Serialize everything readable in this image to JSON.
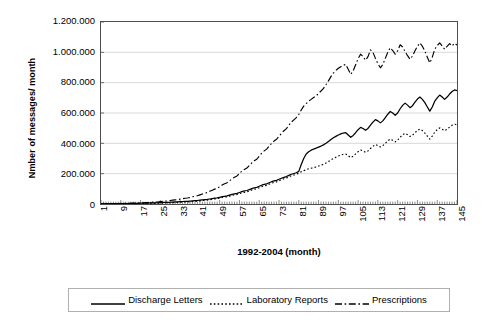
{
  "chart_data": {
    "type": "line",
    "title": "",
    "xlabel": "1992-2004 (month)",
    "ylabel": "Nmber of messages/ month",
    "xlim": [
      1,
      145
    ],
    "ylim": [
      0,
      1200000
    ],
    "grid": true,
    "legend_position": "bottom",
    "y_ticks": [
      "1.200.000",
      "1.000.000",
      "800.000",
      "600.000",
      "400.000",
      "200.000",
      "0"
    ],
    "y_tick_values": [
      1200000,
      1000000,
      800000,
      600000,
      400000,
      200000,
      0
    ],
    "x_ticks": [
      "1",
      "9",
      "17",
      "25",
      "33",
      "41",
      "49",
      "57",
      "65",
      "73",
      "81",
      "89",
      "97",
      "105",
      "113",
      "121",
      "129",
      "137",
      "145"
    ],
    "x_tick_values": [
      1,
      9,
      17,
      25,
      33,
      41,
      49,
      57,
      65,
      73,
      81,
      89,
      97,
      105,
      113,
      121,
      129,
      137,
      145
    ],
    "x": [
      1,
      2,
      3,
      4,
      5,
      6,
      7,
      8,
      9,
      10,
      11,
      12,
      13,
      14,
      15,
      16,
      17,
      18,
      19,
      20,
      21,
      22,
      23,
      24,
      25,
      26,
      27,
      28,
      29,
      30,
      31,
      32,
      33,
      34,
      35,
      36,
      37,
      38,
      39,
      40,
      41,
      42,
      43,
      44,
      45,
      46,
      47,
      48,
      49,
      50,
      51,
      52,
      53,
      54,
      55,
      56,
      57,
      58,
      59,
      60,
      61,
      62,
      63,
      64,
      65,
      66,
      67,
      68,
      69,
      70,
      71,
      72,
      73,
      74,
      75,
      76,
      77,
      78,
      79,
      80,
      81,
      82,
      83,
      84,
      85,
      86,
      87,
      88,
      89,
      90,
      91,
      92,
      93,
      94,
      95,
      96,
      97,
      98,
      99,
      100,
      101,
      102,
      103,
      104,
      105,
      106,
      107,
      108,
      109,
      110,
      111,
      112,
      113,
      114,
      115,
      116,
      117,
      118,
      119,
      120,
      121,
      122,
      123,
      124,
      125,
      126,
      127,
      128,
      129,
      130,
      131,
      132,
      133,
      134,
      135,
      136,
      137,
      138,
      139,
      140,
      141,
      142,
      143,
      144,
      145
    ],
    "series": [
      {
        "name": "Discharge Letters",
        "style": "solid",
        "color": "#000000",
        "values": [
          1000,
          1200,
          1500,
          1400,
          1800,
          2000,
          2200,
          2100,
          2600,
          3000,
          3200,
          3000,
          3500,
          4000,
          4200,
          4500,
          5000,
          5500,
          6000,
          6200,
          7000,
          7500,
          8000,
          8200,
          9000,
          10000,
          11000,
          11500,
          12000,
          13000,
          14000,
          14500,
          15500,
          16500,
          17500,
          18000,
          19500,
          21000,
          22000,
          23000,
          25000,
          27000,
          29000,
          30000,
          33000,
          36000,
          38000,
          40000,
          44000,
          48000,
          51000,
          53000,
          58000,
          63000,
          67000,
          70000,
          76000,
          82000,
          86000,
          89000,
          95000,
          101000,
          106000,
          110000,
          117000,
          124000,
          129000,
          133000,
          140000,
          147000,
          152000,
          156000,
          163000,
          170000,
          176000,
          181000,
          189000,
          196000,
          201000,
          206000,
          215000,
          260000,
          300000,
          330000,
          345000,
          355000,
          362000,
          368000,
          375000,
          382000,
          390000,
          400000,
          412000,
          425000,
          437000,
          446000,
          455000,
          462000,
          468000,
          470000,
          455000,
          440000,
          452000,
          470000,
          490000,
          505000,
          498000,
          486000,
          498000,
          520000,
          540000,
          556000,
          548000,
          535000,
          548000,
          570000,
          592000,
          610000,
          600000,
          585000,
          600000,
          628000,
          650000,
          665000,
          652000,
          635000,
          648000,
          672000,
          692000,
          705000,
          690000,
          668000,
          640000,
          612000,
          640000,
          678000,
          700000,
          718000,
          705000,
          690000,
          705000,
          725000,
          742000,
          752000,
          748000
        ]
      },
      {
        "name": "Laboratory Reports",
        "style": "dotted",
        "color": "#000000",
        "values": [
          500,
          600,
          800,
          700,
          900,
          1000,
          1100,
          1000,
          1300,
          1500,
          1600,
          1500,
          1800,
          2000,
          2100,
          2200,
          2600,
          2900,
          3200,
          3300,
          3800,
          4200,
          4600,
          4800,
          5500,
          6200,
          6800,
          7200,
          8000,
          8800,
          9500,
          9800,
          11000,
          12000,
          13000,
          13500,
          15000,
          16500,
          17500,
          18500,
          20500,
          22500,
          24500,
          25500,
          28500,
          31000,
          33500,
          35000,
          39000,
          42500,
          45500,
          47500,
          52000,
          56500,
          60000,
          62500,
          68000,
          73000,
          77000,
          80000,
          86000,
          92000,
          97000,
          100000,
          107000,
          114000,
          119000,
          123000,
          130000,
          137000,
          142000,
          146000,
          153000,
          160000,
          166000,
          171000,
          179000,
          186000,
          191000,
          196000,
          203000,
          212000,
          220000,
          226000,
          232000,
          236000,
          240000,
          244000,
          250000,
          256000,
          262000,
          270000,
          280000,
          290000,
          300000,
          308000,
          316000,
          322000,
          328000,
          330000,
          318000,
          306000,
          315000,
          330000,
          345000,
          356000,
          350000,
          341000,
          350000,
          366000,
          380000,
          392000,
          385000,
          376000,
          385000,
          400000,
          416000,
          428000,
          420000,
          410000,
          421000,
          440000,
          456000,
          466000,
          457000,
          445000,
          454000,
          470000,
          485000,
          494000,
          484000,
          468000,
          448000,
          428000,
          448000,
          474000,
          490000,
          502000,
          493000,
          483000,
          493000,
          507000,
          519000,
          526000,
          523000
        ]
      },
      {
        "name": "Prescriptions",
        "style": "dashdot",
        "color": "#000000",
        "values": [
          1500,
          1800,
          2200,
          2000,
          2600,
          2900,
          3200,
          3000,
          3800,
          4400,
          4700,
          4400,
          5200,
          5900,
          6200,
          6600,
          7600,
          8400,
          9200,
          9500,
          11000,
          12000,
          13000,
          13500,
          15500,
          17500,
          19500,
          20500,
          23000,
          25500,
          27500,
          28500,
          32000,
          35000,
          38000,
          39500,
          43500,
          48000,
          51000,
          54000,
          60000,
          66000,
          72000,
          75000,
          84000,
          91000,
          98000,
          103000,
          114000,
          125000,
          134000,
          140000,
          153000,
          166000,
          177000,
          185000,
          201000,
          217000,
          228000,
          237000,
          254000,
          271000,
          285000,
          295000,
          315000,
          335000,
          350000,
          362000,
          382000,
          400000,
          415000,
          427000,
          447000,
          466000,
          483000,
          497000,
          520000,
          540000,
          555000,
          570000,
          590000,
          620000,
          645000,
          662000,
          678000,
          690000,
          702000,
          712000,
          730000,
          745000,
          762000,
          786000,
          812000,
          840000,
          863000,
          880000,
          895000,
          905000,
          915000,
          920000,
          888000,
          855000,
          878000,
          918000,
          958000,
          988000,
          972000,
          948000,
          972000,
          1016000,
          1000000,
          960000,
          925000,
          898000,
          920000,
          960000,
          1000000,
          1030000,
          1012000,
          988000,
          1010000,
          1050000,
          1035000,
          1005000,
          978000,
          955000,
          975000,
          1010000,
          1040000,
          1062000,
          1040000,
          1008000,
          968000,
          930000,
          968000,
          1020000,
          1045000,
          1062000,
          1042000,
          1020000,
          1040000,
          1058000,
          1042000,
          1060000,
          1048000
        ]
      }
    ]
  },
  "legend": {
    "entries": [
      {
        "label": "Discharge Letters",
        "style": "solid"
      },
      {
        "label": "Laboratory Reports",
        "style": "dotted"
      },
      {
        "label": "Prescriptions",
        "style": "dashdot"
      }
    ]
  }
}
